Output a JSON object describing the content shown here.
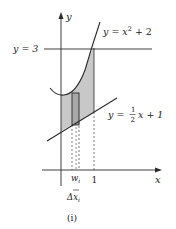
{
  "figure": {
    "caption": "(i)",
    "axis_labels": {
      "x": "x",
      "y": "y"
    },
    "horizontal_line_label": "y = 3",
    "curve_label": {
      "prefix": "y = x",
      "exponent": "2",
      "suffix": " + 2"
    },
    "line_label": {
      "prefix": "y = ",
      "frac_num": "1",
      "frac_den": "2",
      "suffix": "x + 1"
    },
    "tick_labels": {
      "w": "w",
      "w_sub": "i",
      "one": "1"
    },
    "delta_label": {
      "main": "Δx",
      "sub": "i"
    },
    "colors": {
      "shade": "#c8c8c8",
      "rect_fill": "#a8a8a8",
      "stroke": "#2a2a2a"
    }
  }
}
